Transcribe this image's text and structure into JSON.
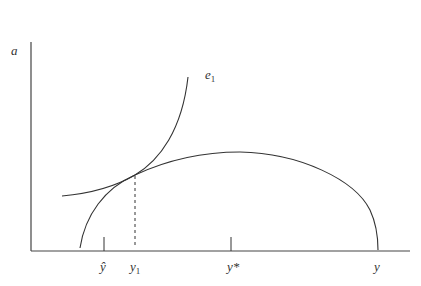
{
  "diagram": {
    "axes": {
      "y_label": "a",
      "x_label": "y"
    },
    "curves": {
      "indifference": {
        "label_base": "e",
        "label_sub": "1"
      },
      "arch": {
        "label": ""
      }
    },
    "x_ticks": [
      {
        "id": "y-hat",
        "label": "ŷ"
      },
      {
        "id": "y1",
        "base": "y",
        "sub": "1"
      },
      {
        "id": "y-star",
        "label": "y*"
      },
      {
        "id": "y-end",
        "label": "y"
      }
    ],
    "colors": {
      "line": "#333333",
      "background": "#ffffff"
    }
  }
}
